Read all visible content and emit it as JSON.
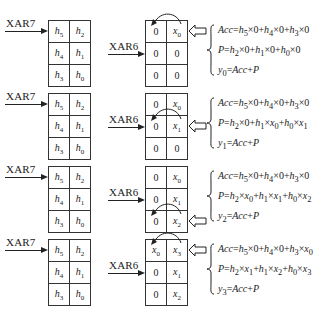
{
  "pointers": {
    "coef": "XAR7",
    "data": "XAR6"
  },
  "blocks": [
    {
      "coef_grid": [
        [
          "h5",
          "h2"
        ],
        [
          "h4",
          "h1"
        ],
        [
          "h3",
          "h0"
        ]
      ],
      "data_grid": [
        [
          "0",
          "x0"
        ],
        [
          "0",
          "0"
        ],
        [
          "0",
          "0"
        ]
      ],
      "input_row": 0,
      "arc_row": 0,
      "equations": [
        "Acc=h5×0+h4×0+h3×0",
        "P=h2×0+h1×0+h0×0",
        "y0=Acc+P"
      ]
    },
    {
      "coef_grid": [
        [
          "h5",
          "h2"
        ],
        [
          "h4",
          "h1"
        ],
        [
          "h3",
          "h0"
        ]
      ],
      "data_grid": [
        [
          "0",
          "x0"
        ],
        [
          "0",
          "x1"
        ],
        [
          "0",
          "0"
        ]
      ],
      "input_row": 1,
      "arc_row": 1,
      "equations": [
        "Acc=h5×0+h4×0+h3×0",
        "P=h2×0+h1×x0+h0×x1",
        "y1=Acc+P"
      ]
    },
    {
      "coef_grid": [
        [
          "h5",
          "h2"
        ],
        [
          "h4",
          "h1"
        ],
        [
          "h3",
          "h0"
        ]
      ],
      "data_grid": [
        [
          "0",
          "x0"
        ],
        [
          "0",
          "x1"
        ],
        [
          "0",
          "x2"
        ]
      ],
      "input_row": 2,
      "arc_row": 2,
      "equations": [
        "Acc=h5×0+h4×0+h3×0",
        "P=h2×x0+h1×x1+h0×x2",
        "y2=Acc+P"
      ]
    },
    {
      "coef_grid": [
        [
          "h5",
          "h2"
        ],
        [
          "h4",
          "h1"
        ],
        [
          "h3",
          "h0"
        ]
      ],
      "data_grid": [
        [
          "x0",
          "x3"
        ],
        [
          "0",
          "x1"
        ],
        [
          "0",
          "x2"
        ]
      ],
      "input_row": 0,
      "arc_row": 0,
      "equations": [
        "Acc=h5×0+h4×0+h3×x0",
        "P=h2×x1+h1×x2+h0×x3",
        "y3=Acc+P"
      ]
    }
  ]
}
